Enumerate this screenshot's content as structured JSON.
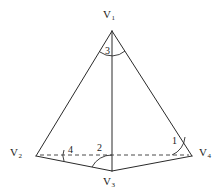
{
  "figure": {
    "kind": "tetrahedron-line-diagram",
    "background_color": "#ffffff",
    "line_color": "#2a2a2a",
    "hidden_line_color": "#4a4a4a",
    "vertices": [
      {
        "id": "v1",
        "label_base": "V",
        "label_sub": "1",
        "x": 112,
        "y": 31,
        "label_x": 103,
        "label_y": 9
      },
      {
        "id": "v2",
        "label_base": "V",
        "label_sub": "2",
        "x": 36,
        "y": 156,
        "label_x": 10,
        "label_y": 147
      },
      {
        "id": "v3",
        "label_base": "V",
        "label_sub": "3",
        "x": 112,
        "y": 171,
        "label_x": 103,
        "label_y": 176
      },
      {
        "id": "v4",
        "label_base": "V",
        "label_sub": "4",
        "x": 192,
        "y": 156,
        "label_x": 199,
        "label_y": 147
      }
    ],
    "angles": [
      {
        "id": "angle-1",
        "label": "1",
        "label_x": 172,
        "label_y": 136
      },
      {
        "id": "angle-2",
        "label": "2",
        "label_x": 97,
        "label_y": 143
      },
      {
        "id": "angle-3",
        "label": "3",
        "label_x": 105,
        "label_y": 46
      },
      {
        "id": "angle-4",
        "label": "4",
        "label_x": 68,
        "label_y": 145
      }
    ],
    "edges": [
      {
        "id": "edge-v1-v2",
        "style": "solid"
      },
      {
        "id": "edge-v1-v3",
        "style": "solid"
      },
      {
        "id": "edge-v1-v4",
        "style": "solid"
      },
      {
        "id": "edge-v2-v3",
        "style": "solid"
      },
      {
        "id": "edge-v3-v4",
        "style": "solid"
      },
      {
        "id": "edge-v2-v4",
        "style": "dashed"
      }
    ]
  }
}
